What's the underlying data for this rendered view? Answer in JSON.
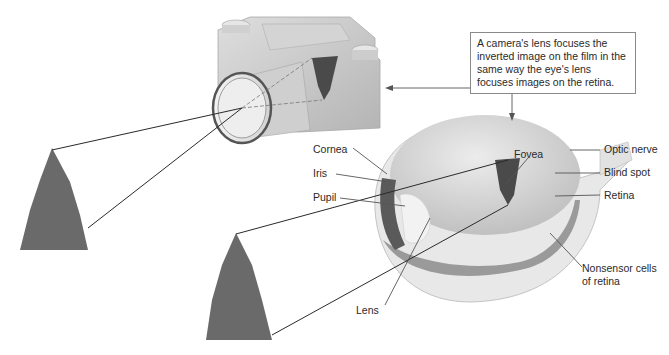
{
  "figure": {
    "callout_text": "A camera's lens focuses the inverted image on the film in the same way the eye's lens focuses images on the retina.",
    "labels": {
      "fovea": "Fovea",
      "optic_nerve": "Optic nerve",
      "blind_spot": "Blind spot",
      "retina": "Retina",
      "cornea": "Cornea",
      "iris": "Iris",
      "pupil": "Pupil",
      "lens": "Lens",
      "nonsensor_line1": "Nonsensor cells",
      "nonsensor_line2": "of retina"
    },
    "illustrations": [
      "camera-icon",
      "eye-cross-section",
      "tree-icon",
      "tree-icon",
      "inverted-tree-on-film",
      "inverted-tree-on-retina"
    ],
    "colors": {
      "line": "#2a2a2a",
      "camera_body": "#c8c8c8",
      "eye_fill": "#d6d6d6",
      "iris": "#5a5a5a",
      "tree": "#6a6a6a"
    }
  }
}
